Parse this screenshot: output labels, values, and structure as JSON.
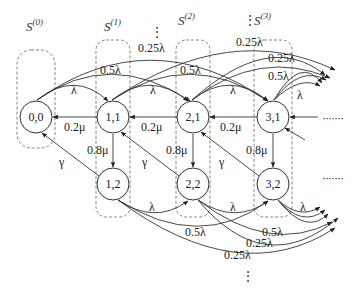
{
  "diagram": {
    "type": "state-transition-markov-chain",
    "sets": [
      {
        "id": "s0",
        "base": "S",
        "sup": "(0)"
      },
      {
        "id": "s1",
        "base": "S",
        "sup": "(1)"
      },
      {
        "id": "s2",
        "base": "S",
        "sup": "(2)"
      },
      {
        "id": "s3",
        "base": "S",
        "sup": "(3)"
      }
    ],
    "nodes": [
      {
        "id": "n00",
        "label": "0,0"
      },
      {
        "id": "n11",
        "label": "1,1"
      },
      {
        "id": "n21",
        "label": "2,1"
      },
      {
        "id": "n31",
        "label": "3,1"
      },
      {
        "id": "n12",
        "label": "1,2"
      },
      {
        "id": "n22",
        "label": "2,2"
      },
      {
        "id": "n32",
        "label": "3,2"
      }
    ],
    "edge_labels": {
      "lambda": "λ",
      "half_lambda": "0.5λ",
      "quarter_lambda": "0.25λ",
      "mu_back": "0.2μ",
      "mu_down": "0.8μ",
      "gamma": "γ"
    },
    "continuation": {
      "horizontal": "·······",
      "vertical": "⋮"
    },
    "edges": [
      {
        "from": "0,0",
        "to": "1,1",
        "label": "λ"
      },
      {
        "from": "0,0",
        "to": "2,1",
        "label": "0.5λ"
      },
      {
        "from": "0,0",
        "to": "3,1",
        "label": "0.25λ"
      },
      {
        "from": "1,1",
        "to": "2,1",
        "label": "λ"
      },
      {
        "from": "1,1",
        "to": "3,1",
        "label": "0.5λ"
      },
      {
        "from": "1,1",
        "to": "4,1",
        "label": "0.25λ"
      },
      {
        "from": "2,1",
        "to": "3,1",
        "label": "λ"
      },
      {
        "from": "3,1",
        "to": "4,1",
        "label": "λ"
      },
      {
        "from": "1,1",
        "to": "0,0",
        "label": "0.2μ"
      },
      {
        "from": "2,1",
        "to": "1,1",
        "label": "0.2μ"
      },
      {
        "from": "3,1",
        "to": "2,1",
        "label": "0.2μ"
      },
      {
        "from": "1,1",
        "to": "1,2",
        "label": "0.8μ"
      },
      {
        "from": "2,1",
        "to": "2,2",
        "label": "0.8μ"
      },
      {
        "from": "3,1",
        "to": "3,2",
        "label": "0.8μ"
      },
      {
        "from": "1,2",
        "to": "0,0",
        "label": "γ"
      },
      {
        "from": "2,2",
        "to": "1,1",
        "label": "γ"
      },
      {
        "from": "3,2",
        "to": "2,1",
        "label": "γ"
      },
      {
        "from": "1,2",
        "to": "2,2",
        "label": "λ"
      },
      {
        "from": "1,2",
        "to": "3,2",
        "label": "0.5λ"
      },
      {
        "from": "1,2",
        "to": "4,2",
        "label": "0.25λ"
      },
      {
        "from": "2,2",
        "to": "3,2",
        "label": "λ"
      },
      {
        "from": "2,2",
        "to": "4,2",
        "label": "0.5λ"
      },
      {
        "from": "2,2",
        "to": "5,2",
        "label": "0.25λ"
      },
      {
        "from": "3,2",
        "to": "4,2",
        "label": "λ"
      }
    ]
  }
}
